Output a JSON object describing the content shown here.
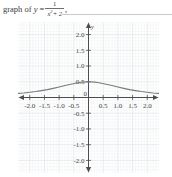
{
  "caption": {
    "lead": "graph of",
    "var": "y",
    "equals": "=",
    "numerator": "1",
    "denominator_base": "x",
    "denominator_exp": "2",
    "denominator_rest": "+ 2",
    "trailing": ","
  },
  "chart_data": {
    "type": "line",
    "function": "y = 1/(x^2 + 2)",
    "xlabel": "x",
    "ylabel": "y",
    "xlim": [
      -2.4,
      2.4
    ],
    "ylim": [
      -2.4,
      2.4
    ],
    "grid": true,
    "grid_minor_step": 0.1,
    "grid_major_step": 0.5,
    "legend": "none",
    "axis_arrows": [
      "left",
      "right",
      "up",
      "down"
    ],
    "x_tick_labels": [
      "-2.0",
      "-1.5",
      "-1.0",
      "-0.5",
      "0",
      "0.5",
      "1.0",
      "1.5",
      "2.0"
    ],
    "x_tick_values": [
      -2.0,
      -1.5,
      -1.0,
      -0.5,
      0,
      0.5,
      1.0,
      1.5,
      2.0
    ],
    "y_tick_labels": [
      "2.0",
      "1.5",
      "1.0",
      "0.5",
      "-0.5",
      "-1.0",
      "-1.5",
      "-2.0"
    ],
    "y_tick_values": [
      2.0,
      1.5,
      1.0,
      0.5,
      -0.5,
      -1.0,
      -1.5,
      -2.0
    ],
    "origin_label": "0",
    "x": [
      -2.4,
      -2.2,
      -2.0,
      -1.8,
      -1.6,
      -1.4,
      -1.2,
      -1.0,
      -0.8,
      -0.6,
      -0.4,
      -0.2,
      0.0,
      0.2,
      0.4,
      0.6,
      0.8,
      1.0,
      1.2,
      1.4,
      1.6,
      1.8,
      2.0,
      2.2,
      2.4
    ],
    "values": [
      0.1297,
      0.1445,
      0.1667,
      0.189,
      0.2193,
      0.2513,
      0.2907,
      0.3333,
      0.3788,
      0.4237,
      0.463,
      0.4902,
      0.5,
      0.4902,
      0.463,
      0.4237,
      0.3788,
      0.3333,
      0.2907,
      0.2513,
      0.2193,
      0.189,
      0.1667,
      0.1445,
      0.1297
    ],
    "max_value": 0.5,
    "max_at_x": 0,
    "curve_color": "#7a7a7a",
    "axis_color": "#4d4d4d",
    "grid_color": "#ebeef0"
  }
}
